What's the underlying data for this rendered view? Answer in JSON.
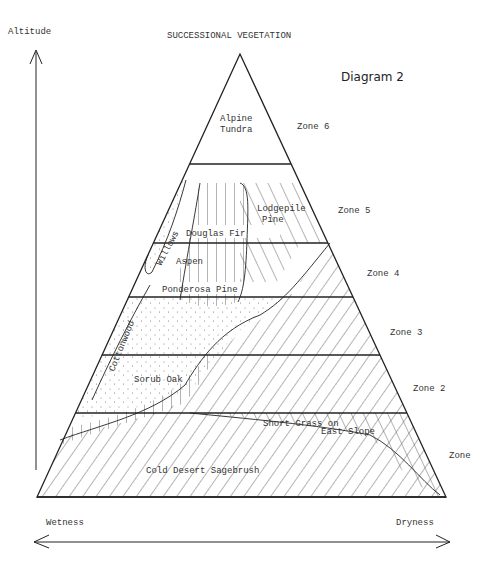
{
  "title": "SUCCESSIONAL VEGETATION",
  "diagram_label": "Diagram 2",
  "axes": {
    "vertical": "Altitude",
    "horizontal_left": "Wetness",
    "horizontal_right": "Dryness"
  },
  "zones": [
    {
      "label": "Zone 6"
    },
    {
      "label": "Zone 5"
    },
    {
      "label": "Zone 4"
    },
    {
      "label": "Zone 3"
    },
    {
      "label": "Zone 2"
    },
    {
      "label": "Zone"
    }
  ],
  "vegetation": {
    "alpine_1": "Alpine",
    "alpine_2": "Tundra",
    "lodgepole_1": "Lodgepile",
    "lodgepole_2": "Pine",
    "douglas_fir": "Douglas Fir",
    "willows": "Willows",
    "aspen": "Aspen",
    "ponderosa": "Ponderosa Pine",
    "cottonwood": "Cottonwood",
    "scrub_oak": "Sorub Oak",
    "short_grass_1": "Short Grass on",
    "short_grass_2": "East Slope",
    "sagebrush": "Cold Desert Sagebrush"
  }
}
